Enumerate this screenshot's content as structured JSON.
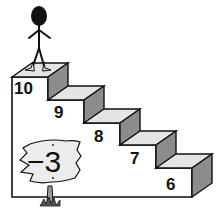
{
  "diagram": {
    "type": "number staircase illustration",
    "steps": [
      {
        "label": "10"
      },
      {
        "label": "9"
      },
      {
        "label": "8"
      },
      {
        "label": "7"
      },
      {
        "label": "6"
      }
    ],
    "sign": {
      "label": "−3"
    },
    "figure": "stick-figure-on-top-step",
    "colors": {
      "outline": "#111111",
      "step_top": "#e4e4e4",
      "step_side": "#8c8c8c",
      "step_front": "#ffffff",
      "sign_fill": "#ececec",
      "post": "#9a9a9a"
    }
  }
}
